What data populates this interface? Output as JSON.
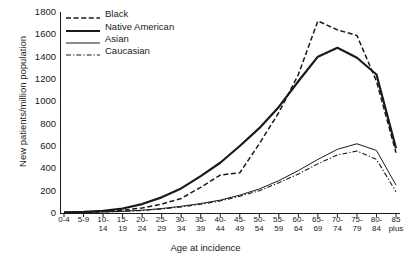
{
  "chart_data": {
    "type": "line",
    "title": "",
    "xlabel": "Age at incidence",
    "ylabel": "New patients/million population",
    "ylim": [
      0,
      1800
    ],
    "yticks": [
      0,
      200,
      400,
      600,
      800,
      1000,
      1200,
      1400,
      1600,
      1800
    ],
    "grid": false,
    "legend_position": "top-left",
    "categories": [
      "0-4",
      "5-9",
      "10-\n14",
      "15-\n19",
      "20-\n24",
      "25-\n29",
      "30-\n34",
      "35-\n39",
      "40-\n44",
      "45-\n49",
      "50-\n54",
      "55-\n59",
      "60-\n64",
      "65-\n69",
      "70-\n74",
      "75-\n79",
      "80-\n84",
      "85\nplus"
    ],
    "series": [
      {
        "name": "Black",
        "style": "dashed",
        "width": 1.5,
        "color": "#1a1a1a",
        "values": [
          5,
          8,
          15,
          25,
          45,
          80,
          130,
          230,
          340,
          360,
          620,
          900,
          1240,
          1720,
          1640,
          1590,
          1180,
          540
        ]
      },
      {
        "name": "Native American",
        "style": "solid-thick",
        "width": 2.2,
        "color": "#1a1a1a",
        "values": [
          5,
          10,
          20,
          40,
          80,
          140,
          220,
          330,
          450,
          600,
          760,
          950,
          1180,
          1400,
          1480,
          1390,
          1240,
          580
        ]
      },
      {
        "name": "Asian",
        "style": "solid-thin",
        "width": 1.0,
        "color": "#1a1a1a",
        "values": [
          3,
          5,
          10,
          15,
          25,
          40,
          60,
          85,
          115,
          160,
          215,
          290,
          380,
          480,
          570,
          620,
          560,
          250
        ]
      },
      {
        "name": "Caucasian",
        "style": "dashdot",
        "width": 1.1,
        "color": "#1a1a1a",
        "values": [
          3,
          5,
          9,
          14,
          22,
          36,
          54,
          78,
          108,
          150,
          200,
          270,
          350,
          440,
          520,
          555,
          480,
          190
        ]
      }
    ]
  },
  "legend": {
    "items": [
      {
        "label": "Black",
        "key": "dashed"
      },
      {
        "label": "Native American",
        "key": "solid-thick"
      },
      {
        "label": "Asian",
        "key": "solid-thin"
      },
      {
        "label": "Caucasian",
        "key": "dashdot"
      }
    ]
  },
  "axes": {
    "y_title": "New patients/million population",
    "x_title": "Age at incidence"
  }
}
